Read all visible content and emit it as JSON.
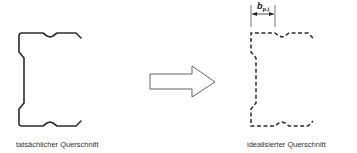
{
  "diagram": {
    "left": {
      "caption": "tatsächlicher Querschnitt",
      "line_style": "solid"
    },
    "arrow": {
      "direction": "right",
      "style": "outline"
    },
    "right": {
      "caption": "idealisierter Querschnitt",
      "line_style": "dashed",
      "dimension": {
        "symbol": "b",
        "subscript": "p,i"
      }
    },
    "colors": {
      "stroke": "#2b2b2b",
      "arrow_stroke": "#555555",
      "text": "#333333"
    }
  }
}
